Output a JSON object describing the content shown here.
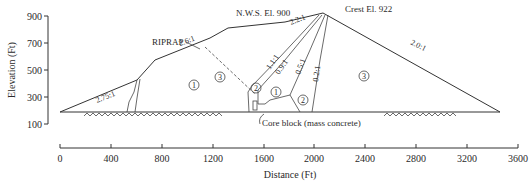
{
  "figure": {
    "y_axis": {
      "label": "Elevation (Ft)",
      "ticks": [
        "900",
        "700",
        "500",
        "300",
        "100"
      ]
    },
    "x_axis": {
      "label": "Distance (Ft)",
      "ticks": [
        "0",
        "400",
        "800",
        "1200",
        "1600",
        "2000",
        "2400",
        "2800",
        "3200",
        "3600"
      ]
    },
    "annotations": {
      "nws": "N.W.S. El. 900",
      "crest": "Crest El. 922",
      "riprap": "RIPRAP",
      "core_block": "Core block (mass concrete)"
    },
    "slopes": {
      "upstream_lower": "2.75:1",
      "upstream_middle": "2.6:1",
      "upstream_upper": "2.2:1",
      "downstream": "2.0:1",
      "core_1": "1.1:1",
      "core_2": "0.9:1",
      "core_3": "0.5:1",
      "core_4": "0.2:1"
    },
    "zones": {
      "z1_upstream": "1",
      "z3_upstream": "3",
      "z2_upper": "2",
      "z1_core": "1",
      "z2_lower": "2",
      "z3_downstream": "3"
    },
    "colors": {
      "line": "#333333",
      "text": "#2a2a2a",
      "background": "#ffffff"
    }
  }
}
